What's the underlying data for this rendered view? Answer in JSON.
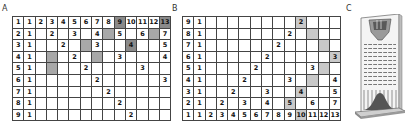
{
  "panels": {
    "A": {
      "label": "A",
      "rows": [
        {
          "label": "1",
          "cells": [
            "1",
            "2",
            "3",
            "4",
            "5",
            "6",
            "7",
            "8",
            "9",
            "10",
            "11",
            "12",
            "13"
          ],
          "shade": {
            "9": "dark",
            "13": "dark"
          }
        },
        {
          "label": "2",
          "cells": [
            "1",
            "",
            "2",
            "",
            "3",
            "",
            "4",
            "",
            "5",
            "",
            "6",
            "",
            "7"
          ],
          "shade": {
            "8": "mid",
            "12": "mid"
          }
        },
        {
          "label": "3",
          "cells": [
            "1",
            "",
            "",
            "2",
            "",
            "",
            "3",
            "",
            "",
            "4",
            "",
            "",
            "5"
          ],
          "shade": {
            "6": "mid",
            "10": "dark"
          }
        },
        {
          "label": "4",
          "cells": [
            "1",
            "",
            "",
            "",
            "2",
            "",
            "",
            "",
            "3",
            "",
            "",
            "",
            "4"
          ],
          "shade": {
            "3": "mid",
            "7": "mid"
          }
        },
        {
          "label": "5",
          "cells": [
            "1",
            "",
            "",
            "",
            "",
            "2",
            "",
            "",
            "",
            "",
            "3",
            "",
            ""
          ],
          "shade": {
            "3": "mid"
          }
        },
        {
          "label": "6",
          "cells": [
            "1",
            "",
            "",
            "",
            "",
            "",
            "2",
            "",
            "",
            "",
            "",
            "",
            "3"
          ],
          "shade": {}
        },
        {
          "label": "7",
          "cells": [
            "1",
            "",
            "",
            "",
            "",
            "",
            "",
            "2",
            "",
            "",
            "",
            "",
            ""
          ],
          "shade": {}
        },
        {
          "label": "8",
          "cells": [
            "1",
            "",
            "",
            "",
            "",
            "",
            "",
            "",
            "2",
            "",
            "",
            "",
            ""
          ],
          "shade": {}
        },
        {
          "label": "9",
          "cells": [
            "1",
            "",
            "",
            "",
            "",
            "",
            "",
            "",
            "",
            "2",
            "",
            "",
            ""
          ],
          "shade": {}
        }
      ]
    },
    "B": {
      "label": "B",
      "rows": [
        {
          "label": "9",
          "cells": [
            "1",
            "",
            "",
            "",
            "",
            "",
            "",
            "",
            "",
            "2",
            "",
            "",
            ""
          ],
          "shade": {
            "10": "light"
          }
        },
        {
          "label": "8",
          "cells": [
            "1",
            "",
            "",
            "",
            "",
            "",
            "",
            "",
            "2",
            "",
            "",
            "",
            ""
          ],
          "shade": {
            "11": "light"
          }
        },
        {
          "label": "7",
          "cells": [
            "1",
            "",
            "",
            "",
            "",
            "",
            "",
            "2",
            "",
            "",
            "",
            "",
            ""
          ],
          "shade": {
            "12": "light"
          }
        },
        {
          "label": "6",
          "cells": [
            "1",
            "",
            "",
            "",
            "",
            "",
            "2",
            "",
            "",
            "",
            "",
            "",
            "3"
          ],
          "shade": {
            "13": "light"
          }
        },
        {
          "label": "5",
          "cells": [
            "1",
            "",
            "",
            "",
            "",
            "2",
            "",
            "",
            "",
            "",
            "3",
            "",
            ""
          ],
          "shade": {
            "12": "light"
          }
        },
        {
          "label": "4",
          "cells": [
            "1",
            "",
            "",
            "",
            "2",
            "",
            "",
            "",
            "3",
            "",
            "",
            "",
            "4"
          ],
          "shade": {
            "11": "light"
          }
        },
        {
          "label": "3",
          "cells": [
            "1",
            "",
            "",
            "2",
            "",
            "",
            "3",
            "",
            "",
            "4",
            "",
            "",
            "5"
          ],
          "shade": {
            "10": "light"
          }
        },
        {
          "label": "2",
          "cells": [
            "1",
            "",
            "2",
            "",
            "3",
            "",
            "4",
            "",
            "5",
            "",
            "6",
            "",
            "7"
          ],
          "shade": {
            "9": "light"
          }
        },
        {
          "label": "1",
          "cells": [
            "1",
            "2",
            "3",
            "4",
            "5",
            "6",
            "7",
            "8",
            "9",
            "10",
            "11",
            "12",
            "13"
          ],
          "shade": {
            "10": "light"
          }
        }
      ]
    },
    "C": {
      "label": "C",
      "image": "galton-board-icon"
    }
  }
}
